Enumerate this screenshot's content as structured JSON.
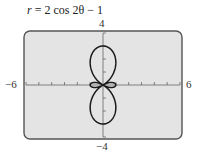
{
  "chart_data": {
    "type": "line",
    "subtype": "polar",
    "title": "r = 2 cos 2θ − 1",
    "equation": {
      "r_label": "r",
      "rest": " = 2 cos 2θ − 1"
    },
    "xlim": [
      -6,
      6
    ],
    "ylim": [
      -4,
      4
    ],
    "x_tick_step": 1,
    "y_tick_step": 1,
    "tick_labels": {
      "xmin": "−6",
      "xmax": "6",
      "ymin": "−4",
      "ymax": "4"
    },
    "grid": false,
    "legend": null,
    "curve": {
      "r_formula": "2*cos(2*theta)-1",
      "theta_range": [
        0,
        6.2832
      ],
      "samples": 720
    },
    "key_points": [
      {
        "theta": "0",
        "r": 1,
        "x": 1,
        "y": 0
      },
      {
        "theta": "π/2",
        "r": -3,
        "x": 0,
        "y": -3
      },
      {
        "theta": "π",
        "r": 1,
        "x": -1,
        "y": 0
      },
      {
        "theta": "3π/2",
        "r": -3,
        "x": 0,
        "y": 3
      }
    ],
    "colors": {
      "frame_fill": "#e4e4e4",
      "frame_border": "#555555",
      "curve": "#1a1a1a",
      "axis": "#666666"
    }
  }
}
